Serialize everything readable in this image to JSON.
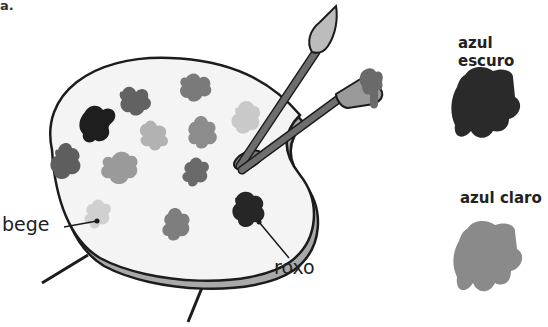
{
  "figure": {
    "corner_label": "a.",
    "callouts": {
      "bege": "bege",
      "roxo": "roxo"
    },
    "swatches": [
      {
        "label": "azul escuro",
        "color": "#2a2a2a"
      },
      {
        "label": "azul claro",
        "color": "#8a8a8a"
      }
    ],
    "palette": {
      "fill": "#f4f4f4",
      "rim_color": "#a9a9a9",
      "outline": "#1c1c1c",
      "blobs": [
        {
          "name": "dark-blob-1",
          "color": "#1e1e1e"
        },
        {
          "name": "blob-2",
          "color": "#626262"
        },
        {
          "name": "blob-3",
          "color": "#7a7a7a"
        },
        {
          "name": "blob-4",
          "color": "#c9c9c9"
        },
        {
          "name": "blob-5",
          "color": "#b2b2b2"
        },
        {
          "name": "blob-6",
          "color": "#8c8c8c"
        },
        {
          "name": "blob-7",
          "color": "#5e5e5e"
        },
        {
          "name": "blob-8",
          "color": "#9a9a9a"
        },
        {
          "name": "blob-9",
          "color": "#6a6a6a"
        },
        {
          "name": "bege-blob",
          "color": "#d0d0d0"
        },
        {
          "name": "blob-11",
          "color": "#7e7e7e"
        },
        {
          "name": "roxo-blob",
          "color": "#262626"
        }
      ]
    }
  }
}
